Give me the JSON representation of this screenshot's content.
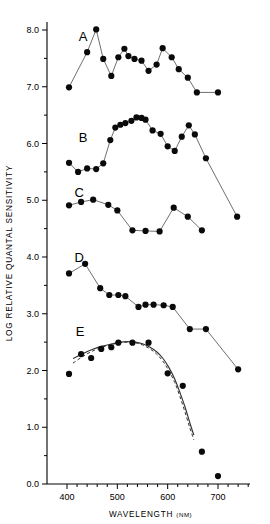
{
  "chart_data": {
    "type": "line",
    "title": "",
    "xlabel": "WAVELENGTH",
    "xlabel_unit": "(NM)",
    "ylabel": "LOG  RELATIVE  QUANTAL  SENSITIVITY",
    "xlim": [
      380,
      760
    ],
    "ylim": [
      0.0,
      8.3
    ],
    "xticks": [
      400,
      500,
      600,
      700
    ],
    "xtick_labels": [
      "400",
      "500",
      "600",
      "700"
    ],
    "xtick_minor_step": 20,
    "yticks": [
      0.0,
      1.0,
      2.0,
      3.0,
      4.0,
      5.0,
      6.0,
      7.0,
      8.0
    ],
    "ytick_labels": [
      "0.0",
      "1.0",
      "2.0",
      "3.0",
      "4.0",
      "5.0",
      "6.0",
      "7.0",
      "8.0"
    ],
    "ytick_minor_step": 0.5,
    "grid": false,
    "legend": "none",
    "marker": "filled-circle",
    "marker_color": "#0a0a0a",
    "line_color": "#555555",
    "series": [
      {
        "name": "A",
        "label": "A",
        "label_x": 432,
        "label_y": 7.8,
        "x": [
          404,
          440,
          458,
          472,
          488,
          502,
          514,
          522,
          534,
          548,
          562,
          578,
          590,
          608,
          622,
          640,
          658,
          700
        ],
        "y": [
          6.99,
          7.61,
          8.01,
          7.49,
          7.19,
          7.52,
          7.67,
          7.54,
          7.49,
          7.46,
          7.28,
          7.39,
          7.68,
          7.52,
          7.31,
          7.16,
          6.9,
          6.9
        ]
      },
      {
        "name": "B",
        "label": "B",
        "label_x": 432,
        "label_y": 6.02,
        "x": [
          404,
          422,
          440,
          458,
          472,
          486,
          496,
          506,
          516,
          528,
          538,
          548,
          556,
          570,
          586,
          600,
          614,
          628,
          642,
          654,
          676,
          738
        ],
        "y": [
          5.66,
          5.5,
          5.56,
          5.55,
          5.65,
          6.06,
          6.28,
          6.33,
          6.36,
          6.4,
          6.46,
          6.45,
          6.42,
          6.23,
          6.17,
          5.95,
          5.87,
          6.12,
          6.32,
          6.16,
          5.74,
          4.71
        ]
      },
      {
        "name": "C",
        "label": "C",
        "label_x": 424,
        "label_y": 5.06,
        "x": [
          404,
          428,
          452,
          482,
          500,
          530,
          556,
          584,
          612,
          640,
          668
        ],
        "y": [
          4.91,
          4.97,
          5.01,
          4.92,
          4.82,
          4.47,
          4.46,
          4.45,
          4.87,
          4.71,
          4.47
        ]
      },
      {
        "name": "D",
        "label": "D",
        "label_x": 424,
        "label_y": 3.92,
        "x": [
          404,
          436,
          466,
          484,
          502,
          516,
          542,
          556,
          572,
          592,
          610,
          644,
          676,
          740
        ],
        "y": [
          3.71,
          3.88,
          3.45,
          3.33,
          3.33,
          3.31,
          3.12,
          3.16,
          3.16,
          3.15,
          3.12,
          2.73,
          2.73,
          2.02
        ]
      },
      {
        "name": "E",
        "label": "E",
        "label_x": 426,
        "label_y": 2.6,
        "x": [
          404,
          428,
          448,
          468,
          488,
          502,
          530,
          562,
          600,
          630,
          668,
          700
        ],
        "y": [
          1.94,
          2.29,
          2.22,
          2.38,
          2.41,
          2.49,
          2.49,
          2.49,
          1.95,
          1.73,
          0.57,
          0.14
        ],
        "connected": false
      }
    ],
    "fitted_curves": [
      {
        "name": "nomogram-solid",
        "style": "solid",
        "x": [
          412,
          430,
          450,
          470,
          490,
          505,
          520,
          535,
          550,
          565,
          578,
          590,
          602,
          614,
          624,
          634,
          644,
          652
        ],
        "y": [
          2.21,
          2.29,
          2.37,
          2.43,
          2.47,
          2.5,
          2.51,
          2.5,
          2.47,
          2.41,
          2.33,
          2.22,
          2.06,
          1.85,
          1.62,
          1.37,
          1.08,
          0.86
        ]
      },
      {
        "name": "nomogram-dashed",
        "style": "dashed",
        "x": [
          412,
          430,
          450,
          470,
          490,
          505,
          520,
          535,
          550,
          565,
          578,
          590,
          602,
          614,
          624,
          634,
          644,
          652
        ],
        "y": [
          2.13,
          2.24,
          2.34,
          2.41,
          2.46,
          2.49,
          2.5,
          2.49,
          2.45,
          2.38,
          2.29,
          2.17,
          2.0,
          1.79,
          1.55,
          1.28,
          0.99,
          0.78
        ]
      }
    ]
  },
  "accent_colors": {
    "marker": "#0a0a0a",
    "line": "#555555",
    "axis": "#000000",
    "background": "#ffffff"
  }
}
